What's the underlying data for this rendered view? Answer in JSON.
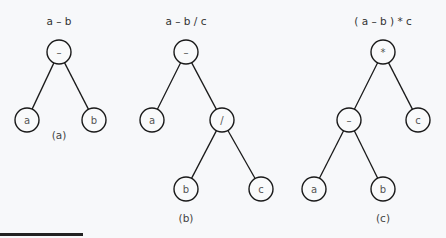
{
  "diagrams": [
    {
      "id": "a",
      "title": "a – b",
      "caption": "(a)",
      "title_pos": [
        59,
        25
      ],
      "caption_pos": [
        59,
        139
      ],
      "nodes": [
        {
          "label": "–",
          "x": 59,
          "y": 52
        },
        {
          "label": "a",
          "x": 27,
          "y": 120
        },
        {
          "label": "b",
          "x": 94,
          "y": 120
        }
      ],
      "edges": [
        [
          0,
          1
        ],
        [
          0,
          2
        ]
      ]
    },
    {
      "id": "b",
      "title": "a –  b / c",
      "caption": "(b)",
      "title_pos": [
        186,
        25
      ],
      "caption_pos": [
        186,
        222
      ],
      "nodes": [
        {
          "label": "–",
          "x": 186,
          "y": 52
        },
        {
          "label": "a",
          "x": 152,
          "y": 120
        },
        {
          "label": "/",
          "x": 222,
          "y": 120
        },
        {
          "label": "b",
          "x": 186,
          "y": 189
        },
        {
          "label": "c",
          "x": 261,
          "y": 189
        }
      ],
      "edges": [
        [
          0,
          1
        ],
        [
          0,
          2
        ],
        [
          2,
          3
        ],
        [
          2,
          4
        ]
      ]
    },
    {
      "id": "c",
      "title": "( a – b ) * c",
      "caption": "(c)",
      "title_pos": [
        383,
        25
      ],
      "caption_pos": [
        383,
        222
      ],
      "nodes": [
        {
          "label": "*",
          "x": 383,
          "y": 52
        },
        {
          "label": "–",
          "x": 349,
          "y": 120
        },
        {
          "label": "c",
          "x": 418,
          "y": 120
        },
        {
          "label": "a",
          "x": 314,
          "y": 189
        },
        {
          "label": "b",
          "x": 383,
          "y": 189
        }
      ],
      "edges": [
        [
          0,
          1
        ],
        [
          0,
          2
        ],
        [
          1,
          3
        ],
        [
          1,
          4
        ]
      ]
    }
  ],
  "node_radius": 12
}
